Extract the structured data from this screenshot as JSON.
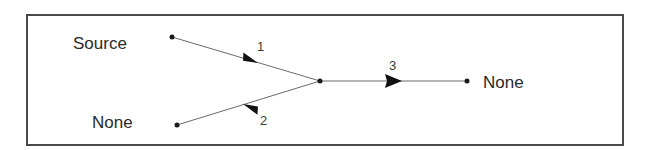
{
  "diagram": {
    "type": "signal-flow-graph",
    "frame": {
      "x": 27,
      "y": 15,
      "width": 596,
      "height": 130,
      "color": "#4a4a4a"
    },
    "nodes": [
      {
        "id": "source",
        "label": "Source",
        "x": 172,
        "y": 37
      },
      {
        "id": "junction",
        "label": "",
        "x": 320,
        "y": 81
      },
      {
        "id": "none_bottom",
        "label": "None",
        "x": 177,
        "y": 125
      },
      {
        "id": "none_right",
        "label": "None",
        "x": 467,
        "y": 81
      }
    ],
    "edges": [
      {
        "id": "1",
        "label": "1",
        "from": "source",
        "to": "junction",
        "direction": "source-to-junction"
      },
      {
        "id": "2",
        "label": "2",
        "from": "junction",
        "to": "none_bottom",
        "direction": "junction-to-none"
      },
      {
        "id": "3",
        "label": "3",
        "from": "junction",
        "to": "none_right",
        "direction": "junction-to-none"
      }
    ],
    "labels": {
      "source": "Source",
      "none_bottom": "None",
      "none_right": "None",
      "edge_1": "1",
      "edge_2": "2",
      "edge_3": "3"
    }
  }
}
